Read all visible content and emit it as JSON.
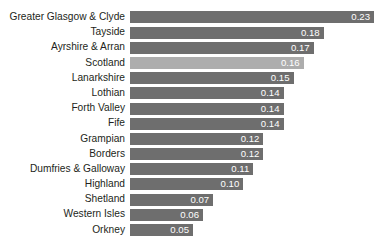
{
  "chart_data": {
    "type": "bar",
    "orientation": "horizontal",
    "title": "",
    "xlabel": "",
    "ylabel": "",
    "grid": false,
    "legend": false,
    "xlim": [
      0.0,
      0.23
    ],
    "bar_color": "#6e6e6e",
    "highlight_color": "#adadad",
    "value_label_color": "#ffffff",
    "category_label_color": "#231f20",
    "background": "#ffffff",
    "highlight_category": "Scotland",
    "categories": [
      "Greater Glasgow & Clyde",
      "Tayside",
      "Ayrshire & Arran",
      "Scotland",
      "Lanarkshire",
      "Lothian",
      "Forth Valley",
      "Fife",
      "Grampian",
      "Borders",
      "Dumfries & Galloway",
      "Highland",
      "Shetland",
      "Western Isles",
      "Orkney"
    ],
    "values": [
      0.23,
      0.18,
      0.17,
      0.16,
      0.15,
      0.14,
      0.14,
      0.14,
      0.12,
      0.12,
      0.11,
      0.1,
      0.07,
      0.06,
      0.05
    ],
    "value_labels": [
      "0.23",
      "0.18",
      "0.17",
      "0.16",
      "0.15",
      "0.14",
      "0.14",
      "0.14",
      "0.12",
      "0.12",
      "0.11",
      "0.10",
      "0.07",
      "0.06",
      "0.05"
    ]
  },
  "rows": [
    {
      "label": "Greater Glasgow & Clyde",
      "value": 0.23,
      "value_label": "0.23",
      "highlight": false
    },
    {
      "label": "Tayside",
      "value": 0.18,
      "value_label": "0.18",
      "highlight": false
    },
    {
      "label": "Ayrshire & Arran",
      "value": 0.17,
      "value_label": "0.17",
      "highlight": false
    },
    {
      "label": "Scotland",
      "value": 0.16,
      "value_label": "0.16",
      "highlight": true
    },
    {
      "label": "Lanarkshire",
      "value": 0.15,
      "value_label": "0.15",
      "highlight": false
    },
    {
      "label": "Lothian",
      "value": 0.14,
      "value_label": "0.14",
      "highlight": false
    },
    {
      "label": "Forth Valley",
      "value": 0.14,
      "value_label": "0.14",
      "highlight": false
    },
    {
      "label": "Fife",
      "value": 0.14,
      "value_label": "0.14",
      "highlight": false
    },
    {
      "label": "Grampian",
      "value": 0.12,
      "value_label": "0.12",
      "highlight": false
    },
    {
      "label": "Borders",
      "value": 0.12,
      "value_label": "0.12",
      "highlight": false
    },
    {
      "label": "Dumfries & Galloway",
      "value": 0.11,
      "value_label": "0.11",
      "highlight": false
    },
    {
      "label": "Highland",
      "value": 0.1,
      "value_label": "0.10",
      "highlight": false
    },
    {
      "label": "Shetland",
      "value": 0.07,
      "value_label": "0.07",
      "highlight": false
    },
    {
      "label": "Western Isles",
      "value": 0.06,
      "value_label": "0.06",
      "highlight": false
    },
    {
      "label": "Orkney",
      "value": 0.05,
      "value_label": "0.05",
      "highlight": false
    }
  ]
}
